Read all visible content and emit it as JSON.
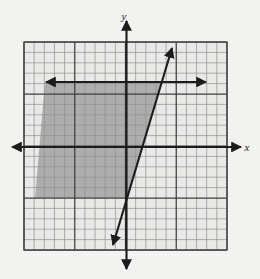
{
  "figure": {
    "title": "",
    "background_color": "#f2f2f0",
    "axis_labels": {
      "x": "x",
      "y": "y"
    },
    "colors": {
      "grid_minor": "#9a9a9a",
      "grid_major": "#4a4a4a",
      "axis": "#1c1c1c",
      "line": "#1c1c1c",
      "shade_fill": "#9c9c9c",
      "plot_background": "#e8e8e6",
      "border": "#5a5a5a"
    }
  },
  "chart_data": {
    "type": "scatter",
    "title": "",
    "xlabel": "x",
    "ylabel": "y",
    "grid": true,
    "legend": null,
    "xlim": [
      -10,
      10
    ],
    "ylim": [
      -10,
      10
    ],
    "grid_cells_x": 20,
    "grid_cells_y": 20,
    "major_grid_every": 5,
    "origin": {
      "x": 0,
      "y": 0
    },
    "annotations": [
      {
        "name": "boundary-line",
        "kind": "line",
        "style": "solid",
        "arrows": "both",
        "points": [
          {
            "x": -1.3,
            "y": -9.7
          },
          {
            "x": 4.5,
            "y": 9.8
          }
        ],
        "slope": 3.36,
        "intercept": -5.3
      },
      {
        "name": "horizontal-boundary-line",
        "kind": "line",
        "style": "solid",
        "arrows": "both",
        "points": [
          {
            "x": -7.9,
            "y": 6.4
          },
          {
            "x": 7.8,
            "y": 6.4
          }
        ],
        "slope": 0,
        "intercept": 6.4
      }
    ],
    "shaded_regions": [
      {
        "name": "solution-region",
        "fill": "#9c9c9c",
        "opacity": 0.75,
        "vertices": [
          {
            "x": -8.0,
            "y": 6.4
          },
          {
            "x": 3.5,
            "y": 6.4
          },
          {
            "x": -0.1,
            "y": -5.0
          },
          {
            "x": -8.6,
            "y": -5.0
          }
        ]
      }
    ]
  },
  "geometry": {
    "plot": {
      "left": 24,
      "top": 42,
      "right": 227,
      "bottom": 250
    },
    "cell": 10.15,
    "axis_y_x": 126.5,
    "axis_x_y": 147.0,
    "x_axis_arrow_left": 12,
    "x_axis_arrow_right": 241,
    "y_axis_arrow_top": 21,
    "y_axis_arrow_bottom": 269,
    "diag_x1": 113,
    "diag_y1": 245,
    "diag_x2": 172,
    "diag_y2": 48,
    "horiz_x1": 46,
    "horiz_x2": 206,
    "horiz_y": 82,
    "shade_top": 82,
    "shade_bottom": 198,
    "shade_left_top": 45,
    "shade_left_bottom": 35,
    "shade_right_top": 162,
    "shade_right_bottom": 128,
    "label_x_pos": {
      "x": 247,
      "y": 151
    },
    "label_y_pos": {
      "x": 124,
      "y": 20
    }
  }
}
